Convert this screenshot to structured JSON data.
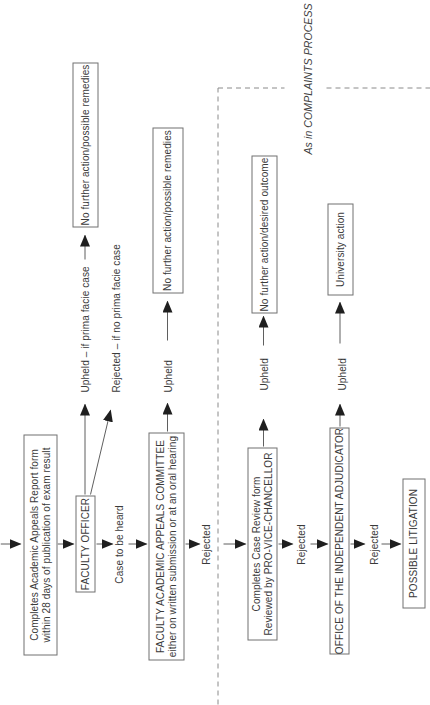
{
  "colors": {
    "background": "#ffffff",
    "ink": "#3a3a3a",
    "connector_line": "#5f5f5f",
    "arrowhead": "#1f1f1f",
    "box_border": "#717171",
    "dashed_boundary": "#8a8a8a"
  },
  "flowchart": {
    "orientation_note_degrees": -90,
    "boxes": {
      "start": {
        "line1": "Completes Academic Appeals Report form",
        "line2": "within 28 days of publication of exam result"
      },
      "faculty_officer": {
        "label": "FACULTY OFFICER"
      },
      "no_action_remedies_1": {
        "label": "No further action/possible remedies"
      },
      "committee": {
        "line1": "FACULTY ACADEMIC APPEALS COMMITTEE",
        "line2": "either on written submission or at an oral hearing"
      },
      "no_action_remedies_2": {
        "label": "No further action/possible remedies"
      },
      "case_review": {
        "line1": "Completes Case Review form",
        "line2": "Reviewed by PRO-VICE-CHANCELLOR"
      },
      "no_action_outcome": {
        "label": "No further action/desired outcome"
      },
      "oia": {
        "label": "OFFICE OF THE INDEPENDENT ADJUDICATOR"
      },
      "university_action": {
        "label": "University action"
      },
      "litigation": {
        "label": "POSSIBLE LITIGATION"
      }
    },
    "labels": {
      "upheld_prima_facie": "Upheld – if prima facie case",
      "rejected_no_prima_facie": "Rejected – if no prima facie case",
      "case_to_be_heard": "Case to be heard",
      "committee_upheld": "Upheld",
      "committee_rejected": "Rejected",
      "pvc_upheld": "Upheld",
      "pvc_rejected": "Rejected",
      "oia_upheld": "Upheld",
      "oia_rejected": "Rejected",
      "complaints_note": "As in COMPLAINTS PROCESS"
    }
  }
}
